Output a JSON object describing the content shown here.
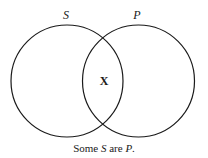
{
  "diagram": {
    "type": "venn",
    "sets": [
      {
        "label": "S",
        "cx": 67,
        "cy": 81,
        "r": 56
      },
      {
        "label": "P",
        "cx": 138.5,
        "cy": 81,
        "r": 56
      }
    ],
    "intersection_mark": "X",
    "caption": {
      "prefix": "Some ",
      "subject": "S",
      "middle": " are ",
      "predicate": "P",
      "suffix": "."
    },
    "stroke_color": "#1a1a1a"
  }
}
